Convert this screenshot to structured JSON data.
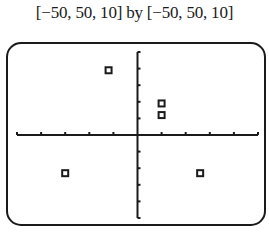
{
  "chart_data": {
    "type": "scatter",
    "title": "[−50, 50, 10] by [−50, 50, 10]",
    "xlabel": "",
    "ylabel": "",
    "xlim": [
      -50,
      50
    ],
    "ylim": [
      -50,
      50
    ],
    "xscale": 10,
    "yscale": 10,
    "grid": false,
    "marker": "square",
    "points": [
      {
        "x": -12,
        "y": 39
      },
      {
        "x": 10,
        "y": 19
      },
      {
        "x": 10,
        "y": 12
      },
      {
        "x": -30,
        "y": -23
      },
      {
        "x": 26,
        "y": -23
      }
    ]
  },
  "colors": {
    "ink": "#1a1a1a",
    "background": "#ffffff"
  }
}
